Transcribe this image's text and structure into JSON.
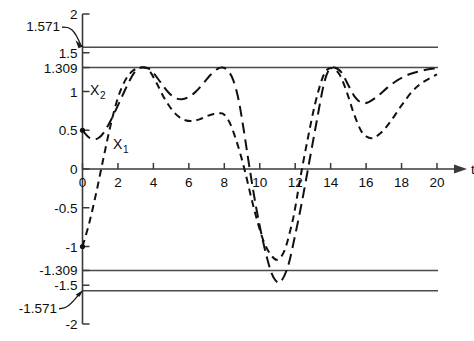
{
  "chart_data": {
    "type": "line",
    "title": "",
    "xlabel": "t",
    "ylabel": "",
    "xlim": [
      0,
      20
    ],
    "ylim": [
      -2,
      2
    ],
    "grid": false,
    "legend_position": "inline-annotation",
    "x_ticks": [
      "0",
      "2",
      "4",
      "6",
      "8",
      "10",
      "12",
      "14",
      "16",
      "18",
      "20"
    ],
    "x_tick_values": [
      0,
      2,
      4,
      6,
      8,
      10,
      12,
      14,
      16,
      18,
      20
    ],
    "y_ticks": [
      "2",
      "1.5",
      "1.309",
      "1",
      "0.5",
      "0",
      "-0.5",
      "-1",
      "-1.309",
      "-1.5",
      "-2"
    ],
    "y_tick_values": [
      2,
      1.5,
      1.309,
      1,
      0.5,
      0,
      -0.5,
      -1,
      -1.309,
      -1.5,
      -2
    ],
    "annotations": [
      {
        "text": "1.571",
        "value": 1.571,
        "kind": "leader-label"
      },
      {
        "text": "-1.571",
        "value": -1.571,
        "kind": "leader-label"
      }
    ],
    "reference_lines": [
      {
        "label": "1.571",
        "value": 1.571
      },
      {
        "label": "1.309",
        "value": 1.309
      },
      {
        "label": "-1.309",
        "value": -1.309
      },
      {
        "label": "-1.571",
        "value": -1.571
      }
    ],
    "series": [
      {
        "name": "X_1",
        "label": "X",
        "subscript": "1",
        "style": "dashed-short",
        "x": [
          0,
          0.4,
          0.8,
          1.2,
          1.6,
          2.0,
          2.4,
          2.8,
          3.2,
          3.5,
          3.8,
          4.2,
          4.6,
          5.0,
          5.4,
          5.8,
          6.2,
          6.6,
          7.0,
          7.4,
          7.8,
          8.0,
          8.3,
          8.6,
          8.9,
          9.2,
          9.5,
          9.8,
          10.2,
          10.6,
          11.0,
          11.4,
          11.8,
          12.0,
          12.3,
          12.7,
          13.1,
          13.5,
          13.8,
          14.1,
          14.5,
          14.9,
          15.3,
          15.7,
          16.0,
          16.4,
          16.9,
          17.4,
          18.0,
          18.6,
          19.2,
          20.0
        ],
        "y": [
          -1.0,
          -0.68,
          -0.28,
          0.16,
          0.58,
          0.92,
          1.14,
          1.26,
          1.305,
          1.309,
          1.26,
          1.1,
          0.92,
          0.78,
          0.68,
          0.63,
          0.62,
          0.64,
          0.68,
          0.71,
          0.72,
          0.7,
          0.6,
          0.42,
          0.2,
          -0.06,
          -0.35,
          -0.62,
          -0.92,
          -1.1,
          -1.17,
          -1.05,
          -0.72,
          -0.5,
          -0.1,
          0.38,
          0.82,
          1.15,
          1.28,
          1.3,
          1.22,
          1.0,
          0.72,
          0.5,
          0.42,
          0.4,
          0.48,
          0.62,
          0.82,
          1.0,
          1.12,
          1.22
        ],
        "start_point": -1.0
      },
      {
        "name": "X_2",
        "label": "X",
        "subscript": "2",
        "style": "dashed-long",
        "x": [
          0,
          0.3,
          0.6,
          0.9,
          1.2,
          1.6,
          2.0,
          2.4,
          2.8,
          3.1,
          3.4,
          3.7,
          4.0,
          4.4,
          4.8,
          5.2,
          5.6,
          6.0,
          6.4,
          6.8,
          7.2,
          7.6,
          7.9,
          8.2,
          8.5,
          8.8,
          9.1,
          9.4,
          9.8,
          10.2,
          10.6,
          10.9,
          11.2,
          11.6,
          12.0,
          12.4,
          12.8,
          13.2,
          13.6,
          13.9,
          14.2,
          14.6,
          15.0,
          15.4,
          15.8,
          16.2,
          16.7,
          17.2,
          17.8,
          18.4,
          19.0,
          19.6,
          20.0
        ],
        "y": [
          0.5,
          0.42,
          0.38,
          0.4,
          0.47,
          0.63,
          0.82,
          1.02,
          1.2,
          1.29,
          1.309,
          1.3,
          1.24,
          1.12,
          1.0,
          0.92,
          0.9,
          0.93,
          1.0,
          1.1,
          1.21,
          1.29,
          1.309,
          1.27,
          1.15,
          0.9,
          0.5,
          0.05,
          -0.5,
          -0.95,
          -1.3,
          -1.44,
          -1.45,
          -1.25,
          -0.85,
          -0.4,
          0.1,
          0.6,
          1.08,
          1.28,
          1.309,
          1.25,
          1.08,
          0.92,
          0.85,
          0.87,
          0.95,
          1.05,
          1.15,
          1.22,
          1.26,
          1.29,
          1.3
        ],
        "start_point": 0.5
      }
    ]
  },
  "axis": {
    "x_name": "t",
    "y_name": ""
  },
  "labels": {
    "series_x1": "X",
    "series_x1_sub": "1",
    "series_x2": "X",
    "series_x2_sub": "2",
    "ann_pos": "1.571",
    "ann_neg": "-1.571"
  },
  "y_tick_labels": {
    "t0": "2",
    "t1": "1.5",
    "t2": "1.309",
    "t3": "1",
    "t4": "0.5",
    "t5": "0",
    "t6": "-0.5",
    "t7": "-1",
    "t8": "-1.309",
    "t9": "-1.5",
    "t10": "-2"
  },
  "x_tick_labels": {
    "t0": "0",
    "t1": "2",
    "t2": "4",
    "t3": "6",
    "t4": "8",
    "t5": "10",
    "t6": "12",
    "t7": "14",
    "t8": "16",
    "t9": "18",
    "t10": "20"
  },
  "colors": {
    "axis": "#3a3a3a",
    "curve": "#111111",
    "gridline": "#4a4a4a",
    "background": "#ffffff"
  }
}
